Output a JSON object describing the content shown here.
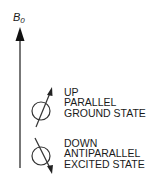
{
  "field": {
    "symbol": "B",
    "subscript": "0"
  },
  "states": [
    {
      "direction": "up",
      "lines": [
        "UP",
        "PARALLEL",
        "GROUND STATE"
      ]
    },
    {
      "direction": "down",
      "lines": [
        "DOWN",
        "ANTIPARALLEL",
        "EXCITED STATE"
      ]
    }
  ],
  "colors": {
    "line": "#444444",
    "text": "#1a1a1a",
    "background": "#ffffff"
  }
}
